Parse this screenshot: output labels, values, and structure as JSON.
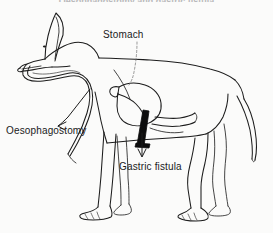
{
  "figure": {
    "title_partial": "Oesophagostomy and gastric fistula",
    "background_color": "#fbfbfa",
    "ink_color": "#1c1c1c",
    "fistula_color": "#0d0d0d",
    "style": "line drawing"
  },
  "labels": {
    "stomach": "Stomach",
    "oesophagostomy": "Oesophagostomy",
    "gastric_fistula": "Gastric fistula"
  },
  "annotations": {
    "stomach_leader": "dashed-leader-line",
    "oesophagostomy_arrow": "arrow-down-left",
    "gastric_fistula_arrow": "arrow-down"
  },
  "anatomy": {
    "oesophageal_loop": "exteriorized-oesophagus-loop",
    "stomach_organ": "stomach",
    "fistula_tube": "gastric-fistula-tube"
  }
}
